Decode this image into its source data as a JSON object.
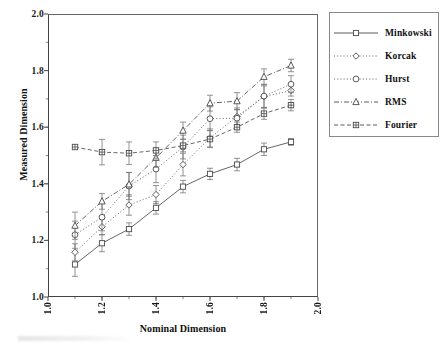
{
  "chart_data": {
    "type": "line",
    "title": "",
    "xlabel": "Nominal Dimension",
    "ylabel": "Measured Dimension",
    "xlim": [
      1.0,
      2.0
    ],
    "ylim": [
      1.0,
      2.0
    ],
    "xticks": [
      "1.0",
      "1.2",
      "1.4",
      "1.6",
      "1.8",
      "2.0"
    ],
    "xtick_values": [
      1.0,
      1.2,
      1.4,
      1.6,
      1.8,
      2.0
    ],
    "yticks": [
      "1.0",
      "1.2",
      "1.4",
      "1.6",
      "1.8",
      "2.0"
    ],
    "ytick_values": [
      1.0,
      1.2,
      1.4,
      1.6,
      1.8,
      2.0
    ],
    "grid": false,
    "legend_position": "right-outside",
    "error_bars": "vertical",
    "x": [
      1.1,
      1.2,
      1.3,
      1.4,
      1.5,
      1.6,
      1.7,
      1.8,
      1.9
    ],
    "series": [
      {
        "name": "Minkowski",
        "marker": "square",
        "line": "solid",
        "values": [
          1.115,
          1.19,
          1.24,
          1.315,
          1.39,
          1.435,
          1.468,
          1.522,
          1.548
        ],
        "errors": [
          0.042,
          0.03,
          0.022,
          0.022,
          0.022,
          0.02,
          0.022,
          0.022,
          0.012
        ]
      },
      {
        "name": "Korcak",
        "marker": "diamond",
        "line": "dotted",
        "values": [
          1.158,
          1.248,
          1.325,
          1.362,
          1.468,
          1.562,
          1.638,
          1.708,
          1.73
        ],
        "errors": [
          0.03,
          0.028,
          0.036,
          0.032,
          0.04,
          0.032,
          0.03,
          0.038,
          0.02
        ]
      },
      {
        "name": "Hurst",
        "marker": "circle",
        "line": "dotted",
        "values": [
          1.22,
          1.282,
          1.392,
          1.452,
          1.53,
          1.63,
          1.632,
          1.71,
          1.752
        ],
        "errors": [
          0.048,
          0.048,
          0.048,
          0.048,
          0.042,
          0.042,
          0.03,
          0.042,
          0.03
        ]
      },
      {
        "name": "RMS",
        "marker": "triangle",
        "line": "dashdot",
        "values": [
          1.252,
          1.338,
          1.398,
          1.492,
          1.588,
          1.685,
          1.692,
          1.778,
          1.818
        ],
        "errors": [
          0.048,
          0.028,
          0.042,
          0.034,
          0.03,
          0.028,
          0.03,
          0.028,
          0.022
        ]
      },
      {
        "name": "Fourier",
        "marker": "square-plus",
        "line": "dashed",
        "values": [
          1.53,
          1.512,
          1.508,
          1.518,
          1.535,
          1.558,
          1.6,
          1.648,
          1.678
        ],
        "errors": [
          0.004,
          0.045,
          0.04,
          0.03,
          0.022,
          0.03,
          0.018,
          0.02,
          0.02
        ]
      }
    ]
  },
  "legend": {
    "entries": [
      {
        "label": "Minkowski"
      },
      {
        "label": "Korcak"
      },
      {
        "label": "Hurst"
      },
      {
        "label": "RMS"
      },
      {
        "label": "Fourier"
      }
    ]
  },
  "axes": {
    "y_title": "Measured Dimension",
    "x_title": "Nominal Dimension"
  }
}
